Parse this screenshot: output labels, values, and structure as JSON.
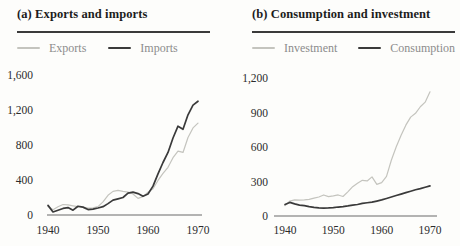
{
  "figure": {
    "colors": {
      "light_series": "#c4c4be",
      "dark_series": "#3a3a3a",
      "rule": "#3a3a3a",
      "axis": "#6b6b6b",
      "legend_text": "#8c8c8c",
      "tick_text": "#2b2b2b",
      "background": "#fdfdfb"
    }
  },
  "chart_data": [
    {
      "type": "line",
      "title": "(a) Exports and imports",
      "xlabel": "",
      "ylabel": "",
      "x_ticks": [
        1940,
        1950,
        1960,
        1970
      ],
      "y_ticks": [
        0,
        400,
        800,
        1200,
        1600
      ],
      "xlim": [
        1940,
        1970
      ],
      "ylim": [
        0,
        1600
      ],
      "grid": false,
      "legend_position": "top",
      "series": [
        {
          "name": "Exports",
          "color": "#c4c4be",
          "points": [
            [
              1940,
              100
            ],
            [
              1941,
              60
            ],
            [
              1942,
              95
            ],
            [
              1943,
              120
            ],
            [
              1944,
              115
            ],
            [
              1945,
              105
            ],
            [
              1946,
              95
            ],
            [
              1947,
              88
            ],
            [
              1948,
              78
            ],
            [
              1949,
              82
            ],
            [
              1950,
              95
            ],
            [
              1951,
              150
            ],
            [
              1952,
              225
            ],
            [
              1953,
              270
            ],
            [
              1954,
              282
            ],
            [
              1955,
              270
            ],
            [
              1956,
              262
            ],
            [
              1957,
              240
            ],
            [
              1958,
              190
            ],
            [
              1959,
              210
            ],
            [
              1960,
              260
            ],
            [
              1961,
              300
            ],
            [
              1962,
              395
            ],
            [
              1963,
              475
            ],
            [
              1964,
              545
            ],
            [
              1965,
              655
            ],
            [
              1966,
              730
            ],
            [
              1967,
              715
            ],
            [
              1968,
              885
            ],
            [
              1969,
              995
            ],
            [
              1970,
              1050
            ]
          ]
        },
        {
          "name": "Imports",
          "color": "#3a3a3a",
          "points": [
            [
              1940,
              110
            ],
            [
              1941,
              35
            ],
            [
              1942,
              55
            ],
            [
              1943,
              75
            ],
            [
              1944,
              85
            ],
            [
              1945,
              55
            ],
            [
              1946,
              100
            ],
            [
              1947,
              90
            ],
            [
              1948,
              62
            ],
            [
              1949,
              68
            ],
            [
              1950,
              80
            ],
            [
              1951,
              95
            ],
            [
              1952,
              130
            ],
            [
              1953,
              170
            ],
            [
              1954,
              185
            ],
            [
              1955,
              200
            ],
            [
              1956,
              250
            ],
            [
              1957,
              262
            ],
            [
              1958,
              245
            ],
            [
              1959,
              215
            ],
            [
              1960,
              240
            ],
            [
              1961,
              330
            ],
            [
              1962,
              470
            ],
            [
              1963,
              600
            ],
            [
              1964,
              715
            ],
            [
              1965,
              880
            ],
            [
              1966,
              1015
            ],
            [
              1967,
              980
            ],
            [
              1968,
              1145
            ],
            [
              1969,
              1255
            ],
            [
              1970,
              1300
            ]
          ]
        }
      ]
    },
    {
      "type": "line",
      "title": "(b) Consumption and investment",
      "xlabel": "",
      "ylabel": "",
      "x_ticks": [
        1940,
        1950,
        1960,
        1970
      ],
      "y_ticks": [
        0,
        300,
        600,
        900,
        1200
      ],
      "xlim": [
        1940,
        1970
      ],
      "ylim": [
        0,
        1200
      ],
      "grid": false,
      "legend_position": "top",
      "series": [
        {
          "name": "Investment",
          "color": "#c4c4be",
          "points": [
            [
              1940,
              90
            ],
            [
              1941,
              130
            ],
            [
              1942,
              140
            ],
            [
              1943,
              138
            ],
            [
              1944,
              140
            ],
            [
              1945,
              145
            ],
            [
              1946,
              155
            ],
            [
              1947,
              165
            ],
            [
              1948,
              183
            ],
            [
              1949,
              168
            ],
            [
              1950,
              175
            ],
            [
              1951,
              183
            ],
            [
              1952,
              170
            ],
            [
              1953,
              210
            ],
            [
              1954,
              255
            ],
            [
              1955,
              285
            ],
            [
              1956,
              310
            ],
            [
              1957,
              305
            ],
            [
              1958,
              340
            ],
            [
              1959,
              275
            ],
            [
              1960,
              290
            ],
            [
              1961,
              345
            ],
            [
              1962,
              485
            ],
            [
              1963,
              600
            ],
            [
              1964,
              700
            ],
            [
              1965,
              790
            ],
            [
              1966,
              860
            ],
            [
              1967,
              893
            ],
            [
              1968,
              950
            ],
            [
              1969,
              990
            ],
            [
              1970,
              1080
            ]
          ]
        },
        {
          "name": "Consumption",
          "color": "#3a3a3a",
          "points": [
            [
              1940,
              100
            ],
            [
              1941,
              118
            ],
            [
              1942,
              105
            ],
            [
              1943,
              95
            ],
            [
              1944,
              90
            ],
            [
              1945,
              82
            ],
            [
              1946,
              75
            ],
            [
              1947,
              70
            ],
            [
              1948,
              68
            ],
            [
              1949,
              70
            ],
            [
              1950,
              73
            ],
            [
              1951,
              78
            ],
            [
              1952,
              82
            ],
            [
              1953,
              88
            ],
            [
              1954,
              95
            ],
            [
              1955,
              100
            ],
            [
              1956,
              110
            ],
            [
              1957,
              115
            ],
            [
              1958,
              120
            ],
            [
              1959,
              130
            ],
            [
              1960,
              140
            ],
            [
              1961,
              152
            ],
            [
              1962,
              165
            ],
            [
              1963,
              178
            ],
            [
              1964,
              190
            ],
            [
              1965,
              203
            ],
            [
              1966,
              215
            ],
            [
              1967,
              228
            ],
            [
              1968,
              238
            ],
            [
              1969,
              250
            ],
            [
              1970,
              262
            ]
          ]
        }
      ]
    }
  ]
}
